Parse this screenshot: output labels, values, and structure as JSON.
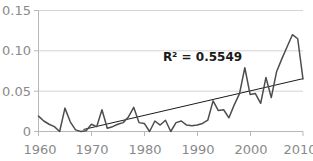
{
  "chart_data": {
    "type": "line",
    "title": "",
    "subtitle": "",
    "xlabel": "",
    "ylabel": "",
    "xlim": [
      1960,
      2010
    ],
    "ylim": [
      0,
      0.15
    ],
    "grid": true,
    "grid_axis": "y",
    "legend": false,
    "legend_position": "none",
    "x_tick_labels": [
      "1960",
      "1970",
      "1980",
      "1990",
      "2000",
      "2010"
    ],
    "x_ticks": [
      1960,
      1970,
      1980,
      1990,
      2000,
      2010
    ],
    "y_tick_labels": [
      "0",
      "0.05",
      "0.10",
      "0.15"
    ],
    "y_ticks": [
      0,
      0.05,
      0.1,
      0.15
    ],
    "annotations": [
      {
        "name": "r-squared",
        "text": "R² = 0.5549",
        "x": 1991,
        "y": 0.088
      }
    ],
    "series": [
      {
        "name": "data-series",
        "type": "line",
        "color": "#4d4d4d",
        "x": [
          1960,
          1961,
          1962,
          1963,
          1964,
          1965,
          1966,
          1967,
          1968,
          1969,
          1970,
          1971,
          1972,
          1973,
          1974,
          1975,
          1976,
          1977,
          1978,
          1979,
          1980,
          1981,
          1982,
          1983,
          1984,
          1985,
          1986,
          1987,
          1988,
          1989,
          1990,
          1991,
          1992,
          1993,
          1994,
          1995,
          1996,
          1997,
          1998,
          1999,
          2000,
          2001,
          2002,
          2003,
          2004,
          2005,
          2006,
          2007,
          2008,
          2009,
          2010
        ],
        "values": [
          0.019,
          0.013,
          0.009,
          0.006,
          0.0,
          0.029,
          0.012,
          0.002,
          0.0,
          0.001,
          0.009,
          0.006,
          0.027,
          0.004,
          0.006,
          0.009,
          0.011,
          0.018,
          0.03,
          0.011,
          0.01,
          0.0,
          0.013,
          0.008,
          0.014,
          0.0,
          0.011,
          0.013,
          0.008,
          0.007,
          0.008,
          0.01,
          0.014,
          0.038,
          0.026,
          0.027,
          0.017,
          0.033,
          0.047,
          0.079,
          0.046,
          0.047,
          0.035,
          0.067,
          0.042,
          0.074,
          0.09,
          0.105,
          0.12,
          0.115,
          0.065
        ]
      },
      {
        "name": "linear-trendline",
        "type": "line",
        "color": "#000000",
        "x": [
          1968.5,
          2010
        ],
        "values": [
          0.0025,
          0.0655
        ]
      }
    ]
  },
  "axes": {
    "y_axis_name": "y-axis",
    "x_axis_name": "x-axis"
  }
}
